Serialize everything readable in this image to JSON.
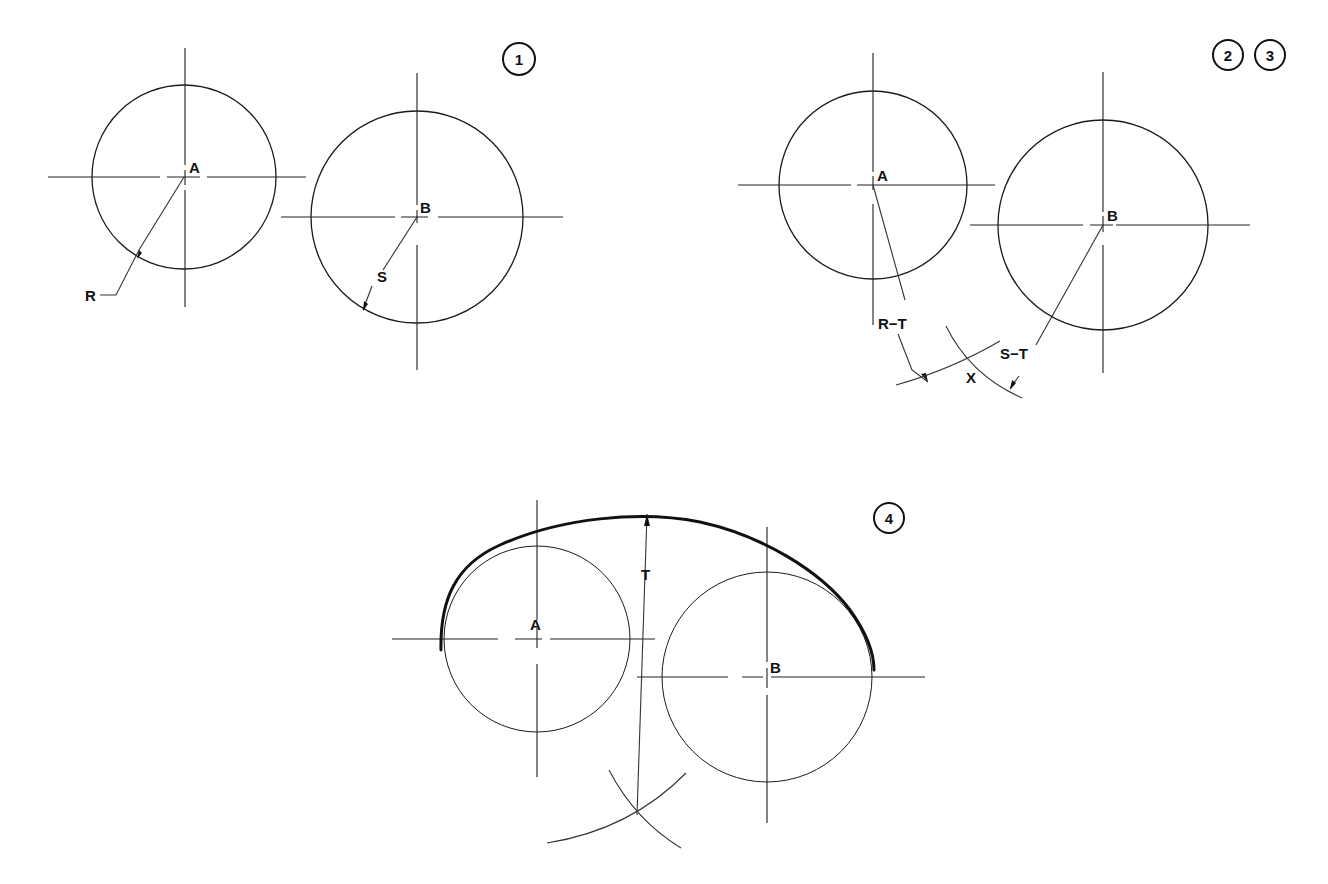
{
  "diagram": {
    "panels": [
      {
        "id": "step-1",
        "step_badges": [
          "1"
        ],
        "badge_positions": [
          [
            519,
            59
          ]
        ],
        "circles": [
          {
            "label": "A",
            "cx": 184,
            "cy": 177,
            "r": 92,
            "radius_label": "R"
          },
          {
            "label": "B",
            "cx": 417,
            "cy": 217,
            "r": 106,
            "radius_label": "S"
          }
        ],
        "labels": {
          "center_a": "A",
          "center_b": "B",
          "radius_a": "R",
          "radius_b": "S"
        }
      },
      {
        "id": "step-2-3",
        "step_badges": [
          "2",
          "3"
        ],
        "badge_positions": [
          [
            1228,
            55
          ],
          [
            1270,
            55
          ]
        ],
        "circles": [
          {
            "label": "A",
            "cx": 873,
            "cy": 185,
            "r": 94
          },
          {
            "label": "B",
            "cx": 1103,
            "cy": 225,
            "r": 105
          }
        ],
        "labels": {
          "center_a": "A",
          "center_b": "B",
          "arc_a": "R−T",
          "arc_b": "S−T",
          "intersection": "X"
        }
      },
      {
        "id": "step-4",
        "step_badges": [
          "4"
        ],
        "badge_positions": [
          [
            889,
            518
          ]
        ],
        "circles": [
          {
            "label": "A",
            "cx": 537,
            "cy": 639,
            "r": 93
          },
          {
            "label": "B",
            "cx": 767,
            "cy": 677,
            "r": 105
          }
        ],
        "labels": {
          "center_a": "A",
          "center_b": "B",
          "tangent_radius": "T"
        }
      }
    ]
  },
  "colors": {
    "ink": "#1a1a1a",
    "paper": "#ffffff"
  }
}
